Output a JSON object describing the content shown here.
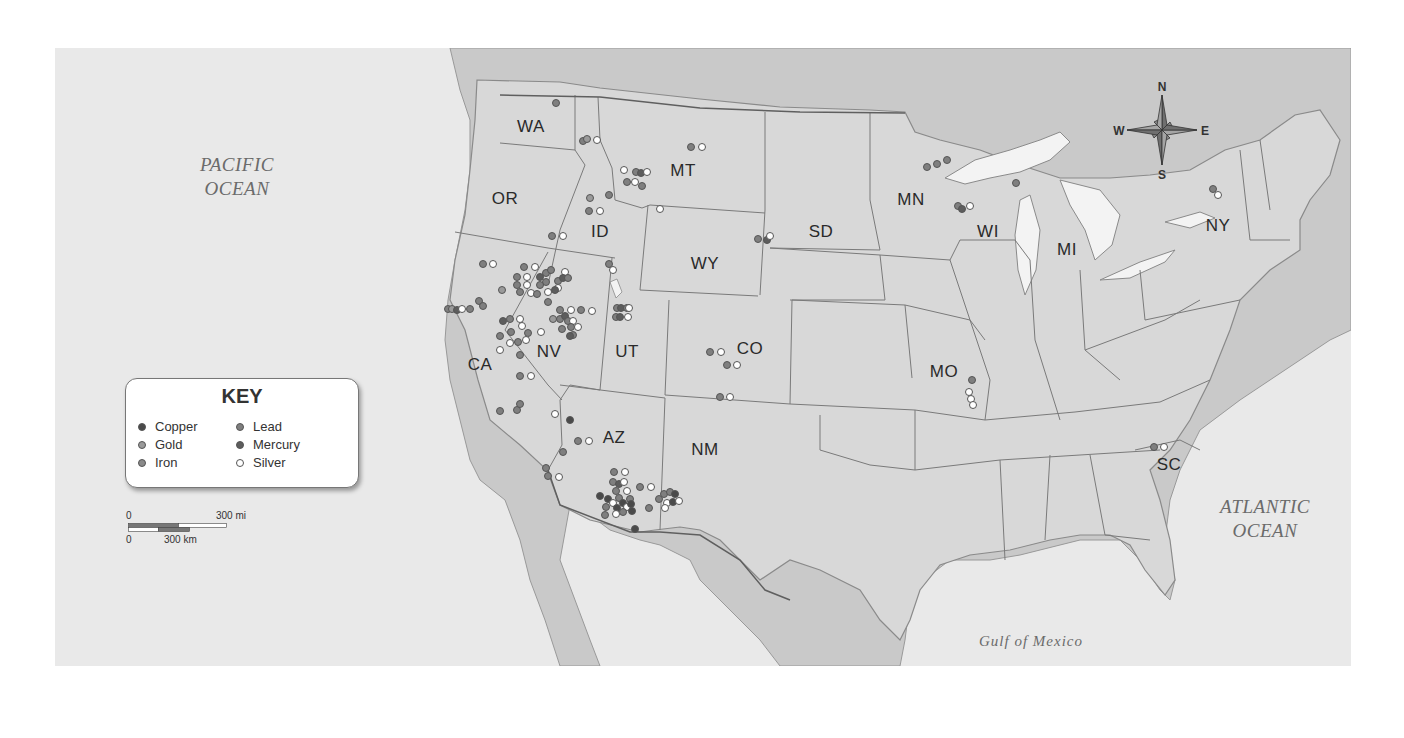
{
  "map": {
    "title": "Mining sites in the United States",
    "oceans": [
      {
        "id": "pacific",
        "lines": [
          "PACIFIC",
          "OCEAN"
        ],
        "x": 237,
        "y": 177
      },
      {
        "id": "atlantic",
        "lines": [
          "ATLANTIC",
          "OCEAN"
        ],
        "x": 1265,
        "y": 519
      },
      {
        "id": "gulf",
        "lines": [
          "Gulf of Mexico"
        ],
        "x": 1031,
        "y": 641
      }
    ],
    "states": [
      {
        "abbr": "WA",
        "x": 531,
        "y": 127
      },
      {
        "abbr": "OR",
        "x": 505,
        "y": 199
      },
      {
        "abbr": "ID",
        "x": 600,
        "y": 232
      },
      {
        "abbr": "MT",
        "x": 683,
        "y": 171
      },
      {
        "abbr": "WY",
        "x": 705,
        "y": 264
      },
      {
        "abbr": "SD",
        "x": 821,
        "y": 232
      },
      {
        "abbr": "MN",
        "x": 911,
        "y": 200
      },
      {
        "abbr": "WI",
        "x": 988,
        "y": 232
      },
      {
        "abbr": "MI",
        "x": 1067,
        "y": 250
      },
      {
        "abbr": "NY",
        "x": 1218,
        "y": 226
      },
      {
        "abbr": "NV",
        "x": 549,
        "y": 352
      },
      {
        "abbr": "UT",
        "x": 627,
        "y": 352
      },
      {
        "abbr": "CA",
        "x": 480,
        "y": 365
      },
      {
        "abbr": "CO",
        "x": 750,
        "y": 349
      },
      {
        "abbr": "MO",
        "x": 944,
        "y": 372
      },
      {
        "abbr": "AZ",
        "x": 614,
        "y": 438
      },
      {
        "abbr": "NM",
        "x": 705,
        "y": 450
      },
      {
        "abbr": "SC",
        "x": 1169,
        "y": 465
      }
    ]
  },
  "key": {
    "title": "KEY",
    "items": [
      {
        "label": "Copper",
        "type": "copper",
        "color": "#4a4a4a"
      },
      {
        "label": "Gold",
        "type": "gold",
        "color": "#9a9a9a"
      },
      {
        "label": "Iron",
        "type": "iron",
        "color": "#8a8a8a"
      },
      {
        "label": "Lead",
        "type": "lead",
        "color": "#7f7f7f"
      },
      {
        "label": "Mercury",
        "type": "mercury",
        "color": "#5d5d5d"
      },
      {
        "label": "Silver",
        "type": "silver",
        "color": "#ffffff"
      }
    ]
  },
  "scale": {
    "top_zero": "0",
    "top_label": "300 mi",
    "bottom_zero": "0",
    "bottom_label": "300 km"
  },
  "compass": {
    "n": "N",
    "s": "S",
    "e": "E",
    "w": "W"
  },
  "sites": [
    {
      "x": 556,
      "y": 103,
      "t": "lead"
    },
    {
      "x": 583,
      "y": 141,
      "t": "lead"
    },
    {
      "x": 587,
      "y": 139,
      "t": "gold"
    },
    {
      "x": 597,
      "y": 140,
      "t": "silver"
    },
    {
      "x": 691,
      "y": 147,
      "t": "lead"
    },
    {
      "x": 702,
      "y": 147,
      "t": "silver"
    },
    {
      "x": 624,
      "y": 170,
      "t": "silver"
    },
    {
      "x": 636,
      "y": 172,
      "t": "lead"
    },
    {
      "x": 641,
      "y": 173,
      "t": "mercury"
    },
    {
      "x": 647,
      "y": 172,
      "t": "silver"
    },
    {
      "x": 627,
      "y": 182,
      "t": "lead"
    },
    {
      "x": 635,
      "y": 182,
      "t": "silver"
    },
    {
      "x": 642,
      "y": 186,
      "t": "lead"
    },
    {
      "x": 609,
      "y": 195,
      "t": "lead"
    },
    {
      "x": 590,
      "y": 198,
      "t": "gold"
    },
    {
      "x": 589,
      "y": 211,
      "t": "lead"
    },
    {
      "x": 600,
      "y": 211,
      "t": "silver"
    },
    {
      "x": 660,
      "y": 209,
      "t": "silver"
    },
    {
      "x": 552,
      "y": 236,
      "t": "lead"
    },
    {
      "x": 563,
      "y": 236,
      "t": "silver"
    },
    {
      "x": 758,
      "y": 239,
      "t": "lead"
    },
    {
      "x": 767,
      "y": 240,
      "t": "mercury"
    },
    {
      "x": 770,
      "y": 236,
      "t": "silver"
    },
    {
      "x": 483,
      "y": 264,
      "t": "lead"
    },
    {
      "x": 493,
      "y": 264,
      "t": "silver"
    },
    {
      "x": 524,
      "y": 267,
      "t": "lead"
    },
    {
      "x": 535,
      "y": 267,
      "t": "silver"
    },
    {
      "x": 546,
      "y": 273,
      "t": "lead"
    },
    {
      "x": 551,
      "y": 270,
      "t": "lead"
    },
    {
      "x": 565,
      "y": 272,
      "t": "silver"
    },
    {
      "x": 517,
      "y": 277,
      "t": "lead"
    },
    {
      "x": 527,
      "y": 277,
      "t": "silver"
    },
    {
      "x": 540,
      "y": 277,
      "t": "mercury"
    },
    {
      "x": 546,
      "y": 282,
      "t": "lead"
    },
    {
      "x": 558,
      "y": 281,
      "t": "lead"
    },
    {
      "x": 563,
      "y": 278,
      "t": "mercury"
    },
    {
      "x": 568,
      "y": 278,
      "t": "lead"
    },
    {
      "x": 517,
      "y": 285,
      "t": "lead"
    },
    {
      "x": 527,
      "y": 285,
      "t": "silver"
    },
    {
      "x": 540,
      "y": 285,
      "t": "lead"
    },
    {
      "x": 558,
      "y": 288,
      "t": "silver"
    },
    {
      "x": 520,
      "y": 292,
      "t": "lead"
    },
    {
      "x": 531,
      "y": 293,
      "t": "silver"
    },
    {
      "x": 537,
      "y": 294,
      "t": "lead"
    },
    {
      "x": 548,
      "y": 292,
      "t": "silver"
    },
    {
      "x": 555,
      "y": 290,
      "t": "mercury"
    },
    {
      "x": 548,
      "y": 302,
      "t": "lead"
    },
    {
      "x": 502,
      "y": 290,
      "t": "gold"
    },
    {
      "x": 609,
      "y": 264,
      "t": "lead"
    },
    {
      "x": 613,
      "y": 270,
      "t": "silver"
    },
    {
      "x": 479,
      "y": 301,
      "t": "lead"
    },
    {
      "x": 483,
      "y": 306,
      "t": "lead"
    },
    {
      "x": 448,
      "y": 309,
      "t": "lead"
    },
    {
      "x": 452,
      "y": 309,
      "t": "gold"
    },
    {
      "x": 457,
      "y": 310,
      "t": "mercury"
    },
    {
      "x": 462,
      "y": 309,
      "t": "silver"
    },
    {
      "x": 470,
      "y": 309,
      "t": "lead"
    },
    {
      "x": 560,
      "y": 310,
      "t": "lead"
    },
    {
      "x": 571,
      "y": 310,
      "t": "silver"
    },
    {
      "x": 581,
      "y": 310,
      "t": "lead"
    },
    {
      "x": 592,
      "y": 311,
      "t": "silver"
    },
    {
      "x": 617,
      "y": 308,
      "t": "lead"
    },
    {
      "x": 621,
      "y": 308,
      "t": "mercury"
    },
    {
      "x": 627,
      "y": 308,
      "t": "lead"
    },
    {
      "x": 629,
      "y": 308,
      "t": "silver"
    },
    {
      "x": 616,
      "y": 317,
      "t": "lead"
    },
    {
      "x": 620,
      "y": 317,
      "t": "mercury"
    },
    {
      "x": 628,
      "y": 317,
      "t": "silver"
    },
    {
      "x": 503,
      "y": 321,
      "t": "mercury"
    },
    {
      "x": 510,
      "y": 319,
      "t": "lead"
    },
    {
      "x": 520,
      "y": 319,
      "t": "silver"
    },
    {
      "x": 553,
      "y": 319,
      "t": "gold"
    },
    {
      "x": 560,
      "y": 319,
      "t": "lead"
    },
    {
      "x": 565,
      "y": 316,
      "t": "mercury"
    },
    {
      "x": 568,
      "y": 321,
      "t": "lead"
    },
    {
      "x": 573,
      "y": 321,
      "t": "silver"
    },
    {
      "x": 522,
      "y": 326,
      "t": "silver"
    },
    {
      "x": 511,
      "y": 332,
      "t": "lead"
    },
    {
      "x": 528,
      "y": 333,
      "t": "lead"
    },
    {
      "x": 541,
      "y": 332,
      "t": "silver"
    },
    {
      "x": 562,
      "y": 329,
      "t": "lead"
    },
    {
      "x": 571,
      "y": 327,
      "t": "lead"
    },
    {
      "x": 578,
      "y": 327,
      "t": "silver"
    },
    {
      "x": 500,
      "y": 336,
      "t": "lead"
    },
    {
      "x": 510,
      "y": 343,
      "t": "silver"
    },
    {
      "x": 518,
      "y": 342,
      "t": "lead"
    },
    {
      "x": 526,
      "y": 340,
      "t": "silver"
    },
    {
      "x": 573,
      "y": 335,
      "t": "lead"
    },
    {
      "x": 570,
      "y": 336,
      "t": "mercury"
    },
    {
      "x": 500,
      "y": 350,
      "t": "silver"
    },
    {
      "x": 520,
      "y": 355,
      "t": "lead"
    },
    {
      "x": 710,
      "y": 352,
      "t": "lead"
    },
    {
      "x": 721,
      "y": 352,
      "t": "silver"
    },
    {
      "x": 727,
      "y": 365,
      "t": "lead"
    },
    {
      "x": 737,
      "y": 365,
      "t": "silver"
    },
    {
      "x": 520,
      "y": 376,
      "t": "lead"
    },
    {
      "x": 531,
      "y": 376,
      "t": "silver"
    },
    {
      "x": 720,
      "y": 397,
      "t": "lead"
    },
    {
      "x": 730,
      "y": 397,
      "t": "silver"
    },
    {
      "x": 500,
      "y": 411,
      "t": "lead"
    },
    {
      "x": 517,
      "y": 410,
      "t": "lead"
    },
    {
      "x": 520,
      "y": 404,
      "t": "lead"
    },
    {
      "x": 555,
      "y": 414,
      "t": "silver"
    },
    {
      "x": 570,
      "y": 420,
      "t": "copper"
    },
    {
      "x": 578,
      "y": 441,
      "t": "lead"
    },
    {
      "x": 589,
      "y": 441,
      "t": "silver"
    },
    {
      "x": 563,
      "y": 452,
      "t": "lead"
    },
    {
      "x": 546,
      "y": 468,
      "t": "lead"
    },
    {
      "x": 548,
      "y": 476,
      "t": "lead"
    },
    {
      "x": 559,
      "y": 477,
      "t": "silver"
    },
    {
      "x": 614,
      "y": 472,
      "t": "lead"
    },
    {
      "x": 625,
      "y": 472,
      "t": "silver"
    },
    {
      "x": 613,
      "y": 482,
      "t": "lead"
    },
    {
      "x": 619,
      "y": 484,
      "t": "mercury"
    },
    {
      "x": 624,
      "y": 482,
      "t": "silver"
    },
    {
      "x": 640,
      "y": 487,
      "t": "lead"
    },
    {
      "x": 651,
      "y": 487,
      "t": "silver"
    },
    {
      "x": 616,
      "y": 491,
      "t": "lead"
    },
    {
      "x": 627,
      "y": 491,
      "t": "silver"
    },
    {
      "x": 600,
      "y": 496,
      "t": "copper"
    },
    {
      "x": 608,
      "y": 499,
      "t": "copper"
    },
    {
      "x": 613,
      "y": 503,
      "t": "silver"
    },
    {
      "x": 619,
      "y": 498,
      "t": "lead"
    },
    {
      "x": 623,
      "y": 503,
      "t": "copper"
    },
    {
      "x": 630,
      "y": 499,
      "t": "lead"
    },
    {
      "x": 606,
      "y": 507,
      "t": "lead"
    },
    {
      "x": 617,
      "y": 508,
      "t": "copper"
    },
    {
      "x": 627,
      "y": 507,
      "t": "silver"
    },
    {
      "x": 623,
      "y": 512,
      "t": "lead"
    },
    {
      "x": 631,
      "y": 504,
      "t": "copper"
    },
    {
      "x": 605,
      "y": 515,
      "t": "lead"
    },
    {
      "x": 616,
      "y": 514,
      "t": "silver"
    },
    {
      "x": 632,
      "y": 511,
      "t": "copper"
    },
    {
      "x": 649,
      "y": 508,
      "t": "lead"
    },
    {
      "x": 659,
      "y": 499,
      "t": "lead"
    },
    {
      "x": 664,
      "y": 494,
      "t": "lead"
    },
    {
      "x": 667,
      "y": 503,
      "t": "silver"
    },
    {
      "x": 665,
      "y": 508,
      "t": "silver"
    },
    {
      "x": 670,
      "y": 492,
      "t": "lead"
    },
    {
      "x": 675,
      "y": 494,
      "t": "copper"
    },
    {
      "x": 673,
      "y": 502,
      "t": "copper"
    },
    {
      "x": 679,
      "y": 501,
      "t": "silver"
    },
    {
      "x": 635,
      "y": 529,
      "t": "copper"
    },
    {
      "x": 927,
      "y": 167,
      "t": "lead"
    },
    {
      "x": 937,
      "y": 164,
      "t": "lead"
    },
    {
      "x": 947,
      "y": 160,
      "t": "lead"
    },
    {
      "x": 1016,
      "y": 183,
      "t": "lead"
    },
    {
      "x": 958,
      "y": 206,
      "t": "lead"
    },
    {
      "x": 962,
      "y": 209,
      "t": "mercury"
    },
    {
      "x": 970,
      "y": 206,
      "t": "silver"
    },
    {
      "x": 972,
      "y": 380,
      "t": "lead"
    },
    {
      "x": 969,
      "y": 392,
      "t": "silver"
    },
    {
      "x": 971,
      "y": 399,
      "t": "silver"
    },
    {
      "x": 973,
      "y": 405,
      "t": "silver"
    },
    {
      "x": 1154,
      "y": 447,
      "t": "lead"
    },
    {
      "x": 1164,
      "y": 447,
      "t": "silver"
    },
    {
      "x": 1213,
      "y": 189,
      "t": "lead"
    },
    {
      "x": 1218,
      "y": 195,
      "t": "silver"
    }
  ]
}
